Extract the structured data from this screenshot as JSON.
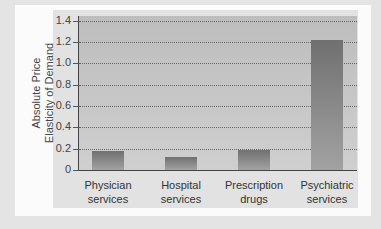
{
  "chart_data": {
    "type": "bar",
    "title": "",
    "xlabel": "",
    "ylabel": "Absolute Price Elasticity of Demand",
    "ylabel_lines": [
      "Absolute Price",
      "Elasticity of Demand"
    ],
    "categories": [
      "Physician services",
      "Hospital services",
      "Prescription drugs",
      "Psychiatric services"
    ],
    "category_lines": [
      [
        "Physician",
        "services"
      ],
      [
        "Hospital",
        "services"
      ],
      [
        "Prescription",
        "drugs"
      ],
      [
        "Psychiatric",
        "services"
      ]
    ],
    "values": [
      0.18,
      0.12,
      0.19,
      1.22
    ],
    "ylim": [
      0,
      1.4
    ],
    "yticks": [
      "0",
      "0.2",
      "0.4",
      "0.6",
      "0.8",
      "1.0",
      "1.2",
      "1.4"
    ],
    "grid": true,
    "legend": null
  },
  "colors": {
    "background": "#e4e4e4",
    "card": "#fbfbfb",
    "panel": "#e2e2e2",
    "plot": "#c6c6c6",
    "bar": "#808080"
  }
}
